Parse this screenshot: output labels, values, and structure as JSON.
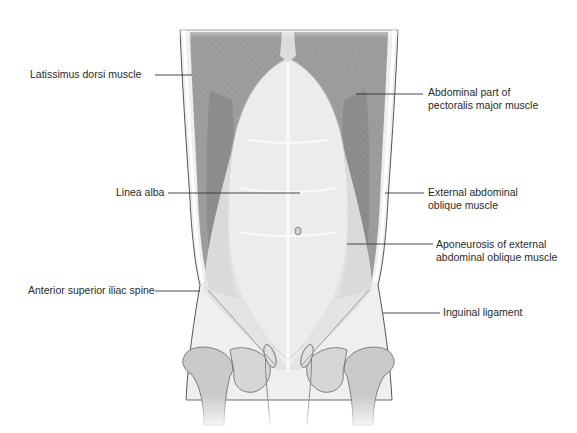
{
  "figure": {
    "colors": {
      "muscle": "#9a9a9a",
      "muscle_dark": "#7d7d7d",
      "aponeurosis": "#e6e6e6",
      "bone": "#c8c8c8",
      "outline": "#555555",
      "leader_line": "#333333",
      "text": "#2a2a2a"
    }
  },
  "labels": {
    "left": [
      {
        "id": "latissimus",
        "text": "Latissimus dorsi muscle"
      },
      {
        "id": "linea_alba",
        "text": "Linea alba"
      },
      {
        "id": "asis",
        "text": "Anterior superior iliac spine"
      }
    ],
    "right": [
      {
        "id": "pectoralis",
        "line1": "Abdominal part of",
        "line2": "pectoralis major muscle"
      },
      {
        "id": "ext_oblique",
        "line1": "External abdominal",
        "line2": "oblique muscle"
      },
      {
        "id": "aponeurosis",
        "line1": "Aponeurosis of external",
        "line2": "abdominal oblique muscle"
      },
      {
        "id": "inguinal",
        "text": "Inguinal ligament"
      }
    ]
  }
}
